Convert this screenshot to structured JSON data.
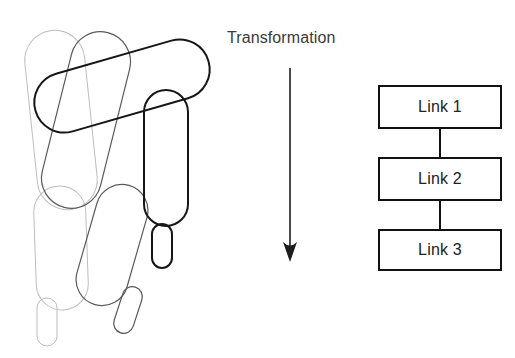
{
  "figure": {
    "background_color": "#ffffff",
    "caption_label": "Transformation"
  },
  "mechanism": {
    "title": "serial-chain-poses",
    "description": "Three overlaid poses of a three-link serial chain pivoting about a common base joint",
    "poses": [
      {
        "name": "pose-light",
        "color": "#bdbdbd",
        "stroke_width": 1,
        "links": [
          {
            "name": "link-1",
            "cx": 61,
            "cy": 120,
            "rx": 30,
            "ry": 90,
            "rotation": -6
          },
          {
            "name": "link-2",
            "cx": 61,
            "cy": 248,
            "rx": 26,
            "ry": 62,
            "rotation": -2
          },
          {
            "name": "link-3",
            "cx": 47,
            "cy": 322,
            "rx": 10,
            "ry": 24,
            "rotation": 0
          }
        ]
      },
      {
        "name": "pose-medium",
        "color": "#5a5a5a",
        "stroke_width": 1.2,
        "links": [
          {
            "name": "link-1",
            "cx": 86,
            "cy": 120,
            "rx": 30,
            "ry": 90,
            "rotation": 14
          },
          {
            "name": "link-2",
            "cx": 112,
            "cy": 245,
            "rx": 26,
            "ry": 62,
            "rotation": 16
          },
          {
            "name": "link-3",
            "cx": 128,
            "cy": 310,
            "rx": 10,
            "ry": 24,
            "rotation": 18
          }
        ]
      },
      {
        "name": "pose-dark",
        "color": "#161616",
        "stroke_width": 2,
        "links": [
          {
            "name": "link-1",
            "cx": 122,
            "cy": 86,
            "rx": 30,
            "ry": 90,
            "rotation": 74
          },
          {
            "name": "link-2",
            "cx": 166,
            "cy": 158,
            "rx": 22,
            "ry": 68,
            "rotation": 0
          },
          {
            "name": "link-3",
            "cx": 162,
            "cy": 246,
            "rx": 10,
            "ry": 22,
            "rotation": 0
          }
        ]
      }
    ]
  },
  "arrow": {
    "name": "transformation-arrow",
    "color": "#1d1d1d",
    "x": 290,
    "y_start": 68,
    "y_end": 262,
    "head_width": 14,
    "head_length": 20
  },
  "block_diagram": {
    "name": "link-chain-blocks",
    "border_color": "#111111",
    "blocks": [
      {
        "label": "Link 1",
        "x": 378,
        "y": 85,
        "w": 124,
        "h": 44
      },
      {
        "label": "Link 2",
        "x": 378,
        "y": 157,
        "w": 124,
        "h": 44
      },
      {
        "label": "Link 3",
        "x": 378,
        "y": 229,
        "w": 124,
        "h": 42
      }
    ],
    "connectors": [
      {
        "name": "connector-1-2",
        "x": 440,
        "y": 129,
        "h": 28
      },
      {
        "name": "connector-2-3",
        "x": 440,
        "y": 201,
        "h": 28
      }
    ]
  }
}
